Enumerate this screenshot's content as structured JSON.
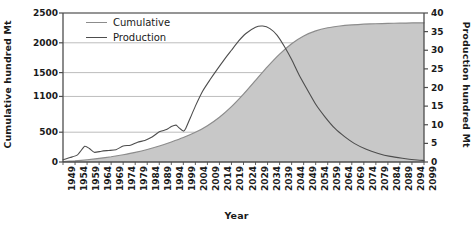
{
  "chart_data": {
    "type": "line",
    "title": "",
    "xlabel": "Year",
    "ylabel": "Cumulative hundred Mt",
    "y2label": "Production hundred Mt",
    "grid": true,
    "legend_position": "top-left",
    "xlim": [
      1949,
      2099
    ],
    "ylim": [
      0,
      2500
    ],
    "y2lim": [
      0,
      40
    ],
    "y_ticks": [
      0,
      500,
      1100,
      1500,
      2000,
      2500
    ],
    "y_tick_labels": [
      "0",
      "500",
      "1100",
      "1500",
      "2000",
      "2500"
    ],
    "y2_ticks": [
      0,
      5,
      10,
      15,
      20,
      25,
      30,
      35,
      40
    ],
    "y2_tick_labels": [
      "0",
      "5",
      "10",
      "15",
      "20",
      "25",
      "30",
      "35",
      "40"
    ],
    "x_ticks": [
      1949,
      1954,
      1959,
      1964,
      1969,
      1974,
      1979,
      1984,
      1989,
      1994,
      1999,
      2004,
      2009,
      2014,
      2019,
      2024,
      2029,
      2034,
      2039,
      2044,
      2049,
      2054,
      2059,
      2064,
      2069,
      2074,
      2079,
      2084,
      2089,
      2094,
      2099
    ],
    "x_tick_labels": [
      "1949",
      "1954",
      "1959",
      "1964",
      "1969",
      "1974",
      "1979",
      "1984",
      "1989",
      "1994",
      "1999",
      "2004",
      "2009",
      "2014",
      "2019",
      "2024",
      "2029",
      "2034",
      "2039",
      "2044",
      "2049",
      "2054",
      "2059",
      "2064",
      "2069",
      "2074",
      "2079",
      "2084",
      "2089",
      "2094",
      "2099"
    ],
    "series": [
      {
        "name": "Cumulative",
        "axis": "left",
        "style": "filled-area",
        "color": "#8c8c8c",
        "fill": "#c8c8c8",
        "x": [
          1949,
          1954,
          1959,
          1964,
          1969,
          1974,
          1979,
          1984,
          1989,
          1994,
          1999,
          2004,
          2009,
          2014,
          2019,
          2024,
          2029,
          2034,
          2039,
          2044,
          2049,
          2054,
          2059,
          2064,
          2069,
          2074,
          2079,
          2084,
          2089,
          2094,
          2099
        ],
        "values": [
          8,
          20,
          38,
          60,
          88,
          122,
          162,
          210,
          268,
          336,
          410,
          498,
          610,
          752,
          930,
          1140,
          1370,
          1600,
          1810,
          1985,
          2115,
          2200,
          2252,
          2282,
          2300,
          2312,
          2320,
          2326,
          2330,
          2333,
          2335
        ]
      },
      {
        "name": "Production",
        "axis": "right",
        "style": "line",
        "color": "#4d4d4d",
        "x": [
          1949,
          1952,
          1955,
          1958,
          1960,
          1962,
          1965,
          1968,
          1971,
          1974,
          1977,
          1980,
          1983,
          1986,
          1989,
          1992,
          1994,
          1996,
          1997,
          1999,
          2000,
          2002,
          2004,
          2007,
          2010,
          2013,
          2016,
          2019,
          2022,
          2025,
          2029,
          2032,
          2035,
          2038,
          2041,
          2044,
          2047,
          2050,
          2054,
          2058,
          2062,
          2066,
          2070,
          2075,
          2080,
          2085,
          2090,
          2095,
          2099
        ],
        "values": [
          0.6,
          1.2,
          1.9,
          4.2,
          3.6,
          2.6,
          2.9,
          3.1,
          3.3,
          4.3,
          4.5,
          5.3,
          5.8,
          6.7,
          8.1,
          8.7,
          9.5,
          9.9,
          9.3,
          8.3,
          9.0,
          12.0,
          15.0,
          19.0,
          22.0,
          24.8,
          27.5,
          30.0,
          32.5,
          34.5,
          36.2,
          36.5,
          35.8,
          34.0,
          31.0,
          27.5,
          23.5,
          20.0,
          15.5,
          12.0,
          9.0,
          6.8,
          5.0,
          3.4,
          2.3,
          1.5,
          1.0,
          0.6,
          0.4
        ]
      }
    ],
    "legend": [
      {
        "label": "Cumulative",
        "color": "#8c8c8c"
      },
      {
        "label": "Production",
        "color": "#4d4d4d"
      }
    ]
  },
  "style": {
    "axis_color": "#4d4d4d",
    "grid_color": "#b5b5b5",
    "text_color": "#1a1a1a",
    "background": "#ffffff"
  }
}
